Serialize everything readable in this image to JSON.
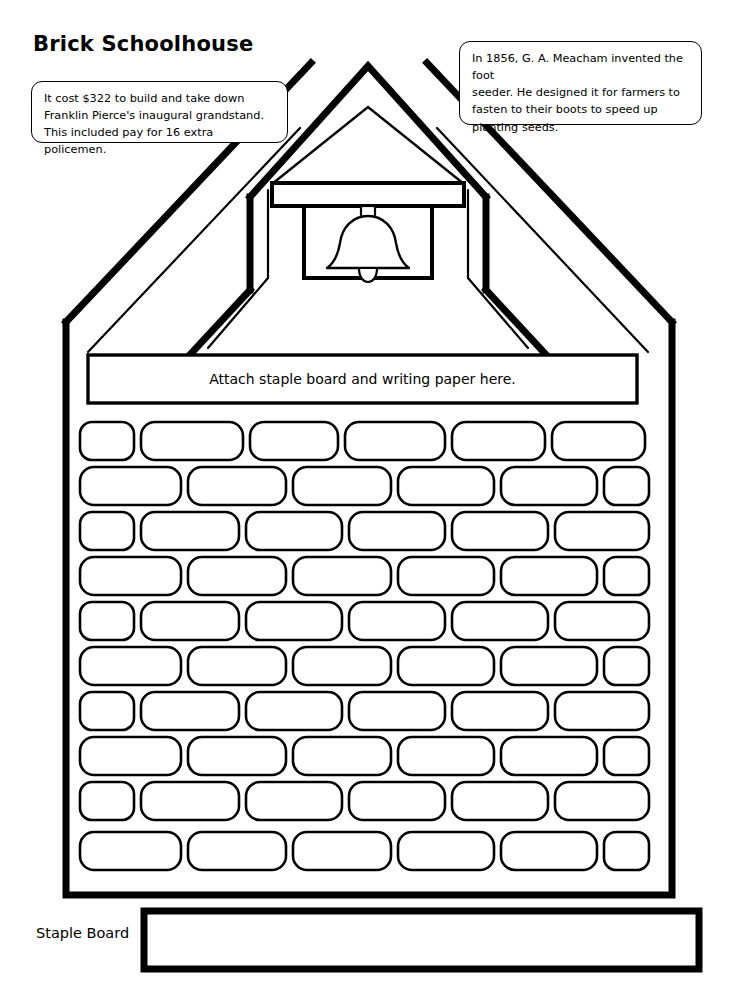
{
  "page": {
    "title": "Brick Schoolhouse",
    "width": 736,
    "height": 989,
    "background_color": "#ffffff",
    "ink_color": "#000000"
  },
  "fact_boxes": [
    {
      "id": "left",
      "text": "It cost $322 to build and take down\nFranklin Pierce's inaugural grandstand.\nThis included pay for 16 extra policemen."
    },
    {
      "id": "right",
      "text": "In 1856, G. A. Meacham invented the foot\nseeder. He designed it for farmers to\nfasten to their boots to speed up\nplanting seeds."
    }
  ],
  "schoolhouse": {
    "banner_text": "Attach staple board and writing paper here.",
    "brick_wall": {
      "rows": 10,
      "pattern": "running-bond",
      "odd_rows_start_with_half_brick": true,
      "bricks_per_full_row": 6
    },
    "bell_tower": {
      "has_bell": true,
      "has_outer_roof_peak": true,
      "has_inner_roof_peak": true,
      "has_beam": true
    }
  },
  "staple_board": {
    "label": "Staple Board",
    "box_is_empty": true
  }
}
